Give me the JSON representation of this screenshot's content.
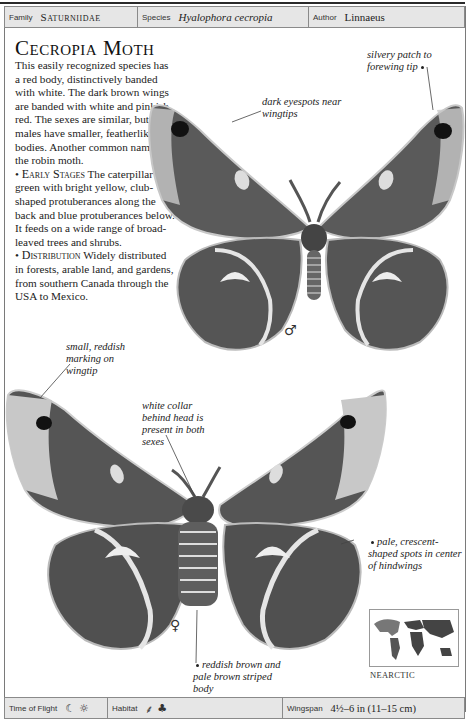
{
  "header": {
    "family_label": "Family",
    "family_value": "Saturniidae",
    "species_label": "Species",
    "species_value": "Hyalophora cecropia",
    "author_label": "Author",
    "author_value": "Linnaeus"
  },
  "article": {
    "title": "Cecropia Moth",
    "intro": "This easily recognized species has a red body, distinctively banded with white. The dark brown wings are banded with white and pinkish red. The sexes are similar, but males have smaller, featherlike bodies. Another common name is the robin moth.",
    "early_stages_heading": "Early Stages",
    "early_stages_text": "The caterpillar is green with bright yellow, club-shaped protuberances along the back and blue protuberances below. It feeds on a wide range of broad-leaved trees and shrubs.",
    "distribution_heading": "Distribution",
    "distribution_text": "Widely distributed in forests, arable land, and gardens, from southern Canada through the USA to Mexico."
  },
  "annotations": {
    "silvery_patch": "silvery patch to forewing tip",
    "dark_eyespots": "dark eyespots near wingtips",
    "small_reddish": "small, reddish marking on wingtip",
    "white_collar": "white collar behind head is present in both sexes",
    "pale_crescent": "pale, crescent-shaped spots in center of hindwings",
    "striped_body": "reddish brown and pale brown striped body"
  },
  "symbols": {
    "male": "♂",
    "female": "♀"
  },
  "map": {
    "region_label": "NEARCTIC"
  },
  "footer": {
    "time_of_flight_label": "Time of Flight",
    "time_icons": [
      "☾",
      "☼"
    ],
    "habitat_label": "Habitat",
    "habitat_icons": [
      "⸙",
      "♣"
    ],
    "wingspan_label": "Wingspan",
    "wingspan_value": "4½–6 in (11–15 cm)"
  },
  "colors": {
    "header_bg": "#e6e6e6",
    "border": "#8a8a8a",
    "wing_dark": "#4a4a4a",
    "wing_mid": "#8a8a8a",
    "wing_pale": "#d8d8d8"
  }
}
